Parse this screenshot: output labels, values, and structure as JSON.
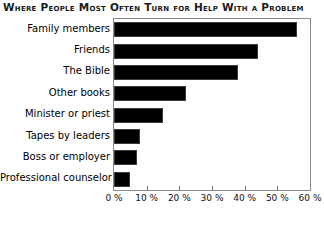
{
  "chart_data": {
    "type": "bar",
    "orientation": "horizontal",
    "title": "Where People Most Often Turn for Help With a Problem",
    "xlabel": "",
    "ylabel": "",
    "categories": [
      "Family members",
      "Friends",
      "The Bible",
      "Other books",
      "Minister or priest",
      "Tapes by leaders",
      "Boss or employer",
      "Professional counselor"
    ],
    "values": [
      56,
      44,
      38,
      22,
      15,
      8,
      7,
      5
    ],
    "value_suffix": "%",
    "xlim": [
      0,
      60
    ],
    "xticks": [
      0,
      10,
      20,
      30,
      40,
      50,
      60
    ],
    "xtick_labels": [
      "0 %",
      "10 %",
      "20 %",
      "30 %",
      "40 %",
      "50 %",
      "60 %"
    ],
    "grid": false,
    "legend": false,
    "bar_color": "#000000",
    "frame_color": "#8a8a8a",
    "background": "#ffffff"
  }
}
